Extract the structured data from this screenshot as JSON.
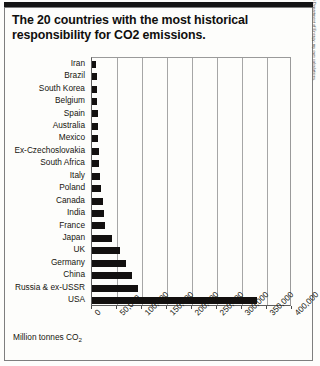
{
  "title": "The 20 countries with the most historical responsibility for CO2 emissions.",
  "source_note": "Raw historical emissions data from the Carbon Dioxide Information Analysis Center (CDIAC), part of the US Department of Energy; my own calculations.",
  "axis_title_text": "Million tonnes CO",
  "axis_title_sub": "2",
  "chart_data": {
    "type": "bar",
    "orientation": "horizontal",
    "title": "The 20 countries with the most historical responsibility for CO2 emissions.",
    "xlabel": "Million tonnes CO2",
    "ylabel": "",
    "xlim": [
      0,
      400000
    ],
    "grid": true,
    "legend": false,
    "xticks": [
      0,
      50000,
      100000,
      150000,
      200000,
      250000,
      300000,
      350000,
      400000
    ],
    "xtick_labels": [
      "0",
      "50,000",
      "100,000",
      "150,000",
      "200,000",
      "250,000",
      "300,000",
      "350,000",
      "400,000"
    ],
    "categories": [
      "Iran",
      "Brazil",
      "South Korea",
      "Belgium",
      "Spain",
      "Australia",
      "Mexico",
      "Ex-Czechoslovakia",
      "South Africa",
      "Italy",
      "Poland",
      "Canada",
      "India",
      "France",
      "Japan",
      "UK",
      "Germany",
      "China",
      "Russia & ex-USSR",
      "USA"
    ],
    "values": [
      8000,
      9000,
      9500,
      10500,
      11000,
      11500,
      12500,
      13500,
      14000,
      15000,
      17000,
      22000,
      24000,
      25000,
      40000,
      55000,
      68000,
      80000,
      92000,
      330000
    ],
    "bar_color": "#12100f"
  }
}
